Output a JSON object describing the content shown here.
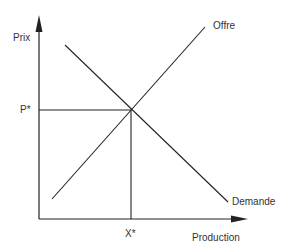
{
  "diagram": {
    "title": "",
    "y_axis_label": "Prix",
    "x_axis_label": "Production",
    "supply_label": "Offre",
    "demand_label": "Demande",
    "equilibrium_price_label": "P*",
    "equilibrium_quantity_label": "X*",
    "line_color": "#222222"
  }
}
